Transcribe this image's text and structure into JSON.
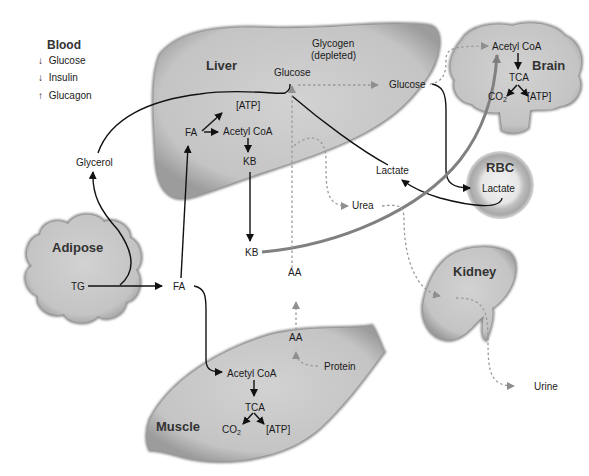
{
  "legend": {
    "title": "Blood",
    "items": [
      {
        "direction": "down",
        "arrow": "↓",
        "label": "Glucose"
      },
      {
        "direction": "down",
        "arrow": "↓",
        "label": "Insulin"
      },
      {
        "direction": "up",
        "arrow": "↑",
        "label": "Glucagon"
      }
    ]
  },
  "organs": {
    "liver": "Liver",
    "brain": "Brain",
    "rbc": "RBC",
    "adipose": "Adipose",
    "kidney": "Kidney",
    "muscle": "Muscle"
  },
  "liver": {
    "glycogen": "Glycogen",
    "glycogen_state": "(depleted)",
    "glucose": "Glucose",
    "atp": "[ATP]",
    "fa": "FA",
    "acetyl_coa": "Acetyl CoA",
    "kb": "KB"
  },
  "brain": {
    "acetyl_coa": "Acetyl CoA",
    "tca": "TCA",
    "co2": "CO",
    "co2_sub": "2",
    "atp": "[ATP]"
  },
  "muscle": {
    "acetyl_coa": "Acetyl CoA",
    "tca": "TCA",
    "co2": "CO",
    "co2_sub": "2",
    "atp": "[ATP]",
    "aa": "AA",
    "protein": "Protein"
  },
  "adipose": {
    "tg": "TG"
  },
  "rbc": {
    "lactate": "Lactate"
  },
  "blood": {
    "glycerol": "Glycerol",
    "fa": "FA",
    "kb": "KB",
    "aa": "AA",
    "glucose": "Glucose",
    "lactate": "Lactate",
    "urea": "Urea",
    "urine": "Urine"
  },
  "colors": {
    "organ_fill": "#c8c8c8",
    "organ_edge": "#8a8a8a",
    "solid_arrow": "#111111",
    "ketone_arrow": "#808080",
    "dashed_arrow": "#9a9a9a"
  }
}
